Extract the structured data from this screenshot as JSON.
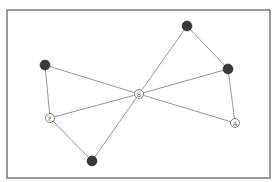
{
  "diagram": {
    "type": "graph",
    "colors": {
      "frame": "#7a7a7a",
      "edge": "#8a8a8a",
      "node_dark": "#3a3a3a",
      "node_light": "#ffffff"
    },
    "nodes": [
      {
        "id": "n1",
        "label": "",
        "style": "dark"
      },
      {
        "id": "n2",
        "label": "",
        "style": "dark"
      },
      {
        "id": "n3",
        "label": "",
        "style": "dark"
      },
      {
        "id": "B",
        "label": "B",
        "style": "light"
      },
      {
        "id": "F",
        "label": "F",
        "style": "light"
      },
      {
        "id": "A",
        "label": "A",
        "style": "light"
      },
      {
        "id": "n4",
        "label": "",
        "style": "dark"
      }
    ],
    "edges": [
      [
        "n1",
        "F"
      ],
      [
        "n1",
        "B"
      ],
      [
        "F",
        "B"
      ],
      [
        "F",
        "n4"
      ],
      [
        "n4",
        "B"
      ],
      [
        "B",
        "n2"
      ],
      [
        "n2",
        "n3"
      ],
      [
        "n3",
        "B"
      ],
      [
        "n3",
        "A"
      ],
      [
        "B",
        "A"
      ]
    ]
  }
}
